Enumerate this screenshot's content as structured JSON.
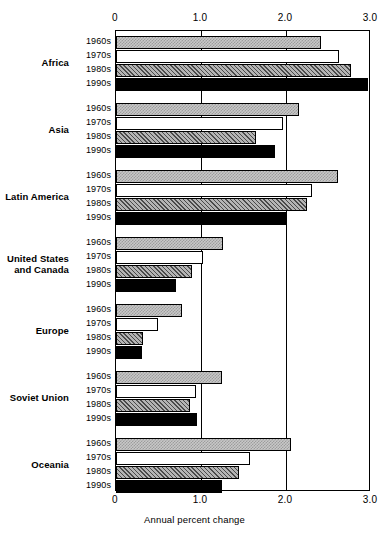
{
  "chart_data": {
    "type": "bar",
    "orientation": "horizontal",
    "title": "",
    "xlabel": "Annual percent change",
    "ylabel": "",
    "xlim": [
      0,
      3.0
    ],
    "xticks": [
      "0",
      "1.0",
      "2.0",
      "3.0"
    ],
    "xtick_values": [
      0,
      1.0,
      2.0,
      3.0
    ],
    "grid": true,
    "legend": "none",
    "series_names": [
      "1960s",
      "1970s",
      "1980s",
      "1990s"
    ],
    "categories": [
      "Africa",
      "Asia",
      "Latin America",
      "United States and Canada",
      "Europe",
      "Soviet Union",
      "Oceania"
    ],
    "series": [
      {
        "name": "1960s",
        "values": [
          2.41,
          2.15,
          2.61,
          1.26,
          0.78,
          1.25,
          2.06
        ]
      },
      {
        "name": "1970s",
        "values": [
          2.62,
          1.96,
          2.31,
          1.02,
          0.49,
          0.94,
          1.58
        ]
      },
      {
        "name": "1980s",
        "values": [
          2.76,
          1.65,
          2.25,
          0.89,
          0.32,
          0.87,
          1.45
        ]
      },
      {
        "name": "1990s",
        "values": [
          2.96,
          1.87,
          2.0,
          0.71,
          0.3,
          0.95,
          1.25
        ]
      }
    ]
  },
  "axis": {
    "top_ticks": [
      "0",
      "1.0",
      "2.0",
      "3.0"
    ],
    "bottom_ticks": [
      "0",
      "1.0",
      "2.0",
      "3.0"
    ],
    "x_title": "Annual percent change"
  },
  "groups": [
    {
      "name": "Africa",
      "rows": [
        {
          "decade": "1960s",
          "value": 2.41,
          "style": "d1960"
        },
        {
          "decade": "1970s",
          "value": 2.62,
          "style": "d1970"
        },
        {
          "decade": "1980s",
          "value": 2.76,
          "style": "d1980"
        },
        {
          "decade": "1990s",
          "value": 2.96,
          "style": "d1990"
        }
      ]
    },
    {
      "name": "Asia",
      "rows": [
        {
          "decade": "1960s",
          "value": 2.15,
          "style": "d1960"
        },
        {
          "decade": "1970s",
          "value": 1.96,
          "style": "d1970"
        },
        {
          "decade": "1980s",
          "value": 1.65,
          "style": "d1980"
        },
        {
          "decade": "1990s",
          "value": 1.87,
          "style": "d1990"
        }
      ]
    },
    {
      "name": "Latin America",
      "rows": [
        {
          "decade": "1960s",
          "value": 2.61,
          "style": "d1960"
        },
        {
          "decade": "1970s",
          "value": 2.31,
          "style": "d1970"
        },
        {
          "decade": "1980s",
          "value": 2.25,
          "style": "d1980"
        },
        {
          "decade": "1990s",
          "value": 2.0,
          "style": "d1990"
        }
      ]
    },
    {
      "name": "United States\nand Canada",
      "rows": [
        {
          "decade": "1960s",
          "value": 1.26,
          "style": "d1960"
        },
        {
          "decade": "1970s",
          "value": 1.02,
          "style": "d1970"
        },
        {
          "decade": "1980s",
          "value": 0.89,
          "style": "d1980"
        },
        {
          "decade": "1990s",
          "value": 0.71,
          "style": "d1990"
        }
      ]
    },
    {
      "name": "Europe",
      "rows": [
        {
          "decade": "1960s",
          "value": 0.78,
          "style": "d1960"
        },
        {
          "decade": "1970s",
          "value": 0.49,
          "style": "d1970"
        },
        {
          "decade": "1980s",
          "value": 0.32,
          "style": "d1980"
        },
        {
          "decade": "1990s",
          "value": 0.3,
          "style": "d1990"
        }
      ]
    },
    {
      "name": "Soviet Union",
      "rows": [
        {
          "decade": "1960s",
          "value": 1.25,
          "style": "d1960"
        },
        {
          "decade": "1970s",
          "value": 0.94,
          "style": "d1970"
        },
        {
          "decade": "1980s",
          "value": 0.87,
          "style": "d1980"
        },
        {
          "decade": "1990s",
          "value": 0.95,
          "style": "d1990"
        }
      ]
    },
    {
      "name": "Oceania",
      "rows": [
        {
          "decade": "1960s",
          "value": 2.06,
          "style": "d1960"
        },
        {
          "decade": "1970s",
          "value": 1.58,
          "style": "d1970"
        },
        {
          "decade": "1980s",
          "value": 1.45,
          "style": "d1980"
        },
        {
          "decade": "1990s",
          "value": 1.25,
          "style": "d1990"
        }
      ]
    }
  ],
  "layout": {
    "plot_left_px": 115,
    "plot_width_px": 255,
    "plot_top_px": 30,
    "plot_height_px": 461,
    "group_gap_px": 12,
    "row_height_px": 13,
    "row_gap_px": 1,
    "group_top_pad_px": 5
  },
  "colors": {
    "frame": "#000000",
    "gridline": "#000000",
    "bar_1960s": "#c8c8c8",
    "bar_1970s": "#ffffff",
    "bar_1980s": "#b4b4b4",
    "bar_1990s": "#000000",
    "background": "#ffffff"
  }
}
